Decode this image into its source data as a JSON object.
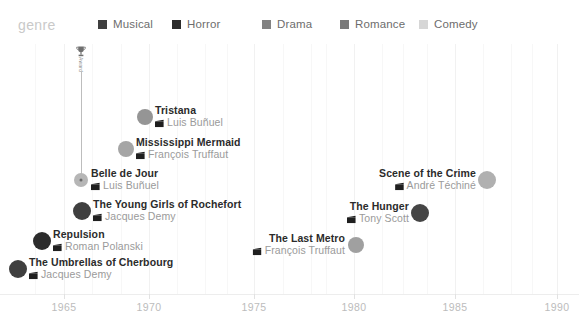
{
  "legend": {
    "title": "genre",
    "items": [
      {
        "label": "Musical",
        "color": "#3f3f3f",
        "x": 98
      },
      {
        "label": "Horror",
        "color": "#2c2c2c",
        "x": 172
      },
      {
        "label": "Drama",
        "color": "#828282",
        "x": 262
      },
      {
        "label": "Romance",
        "color": "#7a7a7a",
        "x": 340
      },
      {
        "label": "Comedy",
        "color": "#d6d6d6",
        "x": 419
      }
    ]
  },
  "annotation": {
    "icon_name": "award-trophy-icon",
    "label": "Award",
    "x": 81,
    "icon_y": 44,
    "text_y": 57,
    "line_top": 72,
    "line_bottom": 180
  },
  "chart_data": {
    "type": "scatter",
    "title": "",
    "xlabel": "",
    "ylabel": "",
    "xlim": [
      1963.2,
      1991.0
    ],
    "grid": true,
    "legend_position": "top",
    "xticks": [
      1965,
      1970,
      1975,
      1980,
      1985,
      1990
    ],
    "xtick_px": [
      64,
      149,
      254,
      354,
      455,
      557
    ],
    "gridline_px": [
      35,
      64,
      92,
      121,
      149,
      177,
      205,
      227,
      254,
      283,
      311,
      326,
      354,
      382,
      403,
      427,
      455,
      483,
      511,
      532,
      557
    ],
    "points": [
      {
        "title": "The Umbrellas of Cherbourg",
        "director": "Jacques Demy",
        "genre": "Musical",
        "year": 1964,
        "color": "#3f3f3f",
        "x": 18,
        "y": 269,
        "r": 9,
        "label_side": "right",
        "label_x": 29,
        "label_y": 269,
        "highlight": false
      },
      {
        "title": "Repulsion",
        "director": "Roman Polanski",
        "genre": "Horror",
        "year": 1965,
        "color": "#2c2c2c",
        "x": 42,
        "y": 241,
        "r": 9,
        "label_side": "right",
        "label_x": 53,
        "label_y": 241,
        "highlight": false
      },
      {
        "title": "Belle de Jour",
        "director": "Luis Buñuel",
        "genre": "Drama",
        "year": 1967,
        "color": "#b6b6b6",
        "x": 81,
        "y": 180,
        "r": 7,
        "label_side": "right",
        "label_x": 91,
        "label_y": 180,
        "highlight": true
      },
      {
        "title": "The Young Girls of Rochefort",
        "director": "Jacques Demy",
        "genre": "Musical",
        "year": 1967,
        "color": "#3f3f3f",
        "x": 82,
        "y": 211,
        "r": 9,
        "label_side": "right",
        "label_x": 93,
        "label_y": 211,
        "highlight": false
      },
      {
        "title": "Mississippi Mermaid",
        "director": "François Truffaut",
        "genre": "Drama",
        "year": 1969,
        "color": "#a5a5a5",
        "x": 126,
        "y": 149,
        "r": 8,
        "label_side": "right",
        "label_x": 136,
        "label_y": 149,
        "highlight": false
      },
      {
        "title": "Tristana",
        "director": "Luis Buñuel",
        "genre": "Drama",
        "year": 1970,
        "color": "#959595",
        "x": 145,
        "y": 117,
        "r": 8,
        "label_side": "right",
        "label_x": 155,
        "label_y": 117,
        "highlight": false
      },
      {
        "title": "The Last Metro",
        "director": "François Truffaut",
        "genre": "Drama",
        "year": 1980,
        "color": "#a0a0a0",
        "x": 356,
        "y": 245,
        "r": 8,
        "label_side": "left",
        "label_x": 345,
        "label_y": 245,
        "highlight": false
      },
      {
        "title": "The Hunger",
        "director": "Tony Scott",
        "genre": "Horror",
        "year": 1983,
        "color": "#454545",
        "x": 420,
        "y": 213,
        "r": 9,
        "label_side": "left",
        "label_x": 409,
        "label_y": 213,
        "highlight": false
      },
      {
        "title": "Scene of the Crime",
        "director": "André Téchiné",
        "genre": "Drama",
        "year": 1986,
        "color": "#b0b0b0",
        "x": 487,
        "y": 180,
        "r": 9,
        "label_side": "left",
        "label_x": 476,
        "label_y": 180,
        "highlight": false
      }
    ]
  }
}
